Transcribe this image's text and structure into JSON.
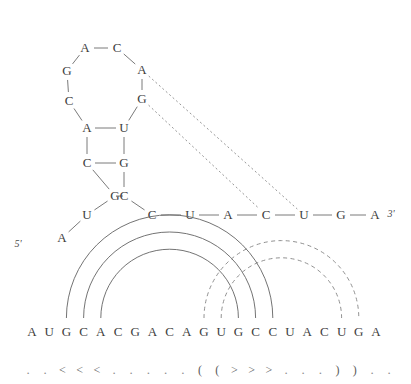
{
  "figure": {
    "type": "rna-secondary-structure",
    "end_labels": {
      "five_prime": "5'",
      "three_prime": "3'"
    }
  },
  "structure_diagram": {
    "nucleotides": [
      {
        "id": 1,
        "base": "A",
        "x": 62,
        "y": 238
      },
      {
        "id": 2,
        "base": "U",
        "x": 87,
        "y": 215
      },
      {
        "id": 3,
        "base": "G",
        "x": 115,
        "y": 196
      },
      {
        "id": 4,
        "base": "C",
        "x": 87,
        "y": 163
      },
      {
        "id": 5,
        "base": "A",
        "x": 87,
        "y": 128
      },
      {
        "id": 6,
        "base": "C",
        "x": 69,
        "y": 101
      },
      {
        "id": 7,
        "base": "G",
        "x": 67,
        "y": 71
      },
      {
        "id": 8,
        "base": "A",
        "x": 85,
        "y": 48
      },
      {
        "id": 9,
        "base": "C",
        "x": 117,
        "y": 48
      },
      {
        "id": 10,
        "base": "A",
        "x": 142,
        "y": 70
      },
      {
        "id": 11,
        "base": "G",
        "x": 142,
        "y": 99
      },
      {
        "id": 12,
        "base": "U",
        "x": 124,
        "y": 128
      },
      {
        "id": 13,
        "base": "G",
        "x": 124,
        "y": 163
      },
      {
        "id": 14,
        "base": "C",
        "x": 124,
        "y": 196
      },
      {
        "id": 15,
        "base": "C",
        "x": 152,
        "y": 215
      },
      {
        "id": 16,
        "base": "U",
        "x": 190,
        "y": 215
      },
      {
        "id": 17,
        "base": "A",
        "x": 228,
        "y": 215
      },
      {
        "id": 18,
        "base": "C",
        "x": 266,
        "y": 215
      },
      {
        "id": 19,
        "base": "U",
        "x": 304,
        "y": 215
      },
      {
        "id": 20,
        "base": "G",
        "x": 341,
        "y": 215
      },
      {
        "id": 21,
        "base": "A",
        "x": 375,
        "y": 215
      }
    ],
    "backbone_bonds": [
      [
        1,
        2
      ],
      [
        2,
        3
      ],
      [
        3,
        4
      ],
      [
        4,
        5
      ],
      [
        5,
        6
      ],
      [
        6,
        7
      ],
      [
        7,
        8
      ],
      [
        8,
        9
      ],
      [
        9,
        10
      ],
      [
        10,
        11
      ],
      [
        11,
        12
      ],
      [
        12,
        13
      ],
      [
        13,
        14
      ],
      [
        14,
        15
      ],
      [
        15,
        16
      ],
      [
        16,
        17
      ],
      [
        17,
        18
      ],
      [
        18,
        19
      ],
      [
        19,
        20
      ],
      [
        20,
        21
      ]
    ],
    "base_pairs_solid": [
      [
        3,
        14
      ],
      [
        4,
        13
      ],
      [
        5,
        12
      ]
    ],
    "base_pairs_dashed": [
      [
        10,
        19
      ],
      [
        11,
        18
      ]
    ],
    "five_prime_label": {
      "text": "5'",
      "x": 18,
      "y": 243
    },
    "three_prime_label": {
      "text": "3'",
      "x": 391,
      "y": 213
    }
  },
  "arc_diagram": {
    "sequence": [
      "A",
      "U",
      "G",
      "C",
      "A",
      "C",
      "G",
      "A",
      "C",
      "A",
      "G",
      "U",
      "G",
      "C",
      "C",
      "U",
      "A",
      "C",
      "U",
      "G",
      "A"
    ],
    "structure_string": "..<<<.....((>>>...))..",
    "structure_chars": [
      ".",
      ".",
      "<",
      "<",
      "<",
      ".",
      ".",
      ".",
      ".",
      ".",
      "(",
      "(",
      ">",
      ">",
      ">",
      ".",
      ".",
      ".",
      ")",
      ")",
      ".",
      "."
    ],
    "arcs_solid": [
      [
        3,
        15
      ],
      [
        4,
        14
      ],
      [
        5,
        13
      ]
    ],
    "arcs_dashed": [
      [
        11,
        20
      ],
      [
        12,
        19
      ]
    ],
    "baseline_y": 332,
    "first_x": 32,
    "spacing": 17.2,
    "struct_y": 370
  },
  "colors": {
    "ink": "#3d3d3d",
    "line": "#6b6b6b",
    "dashed": "#8a8a8a",
    "background": "#ffffff"
  }
}
